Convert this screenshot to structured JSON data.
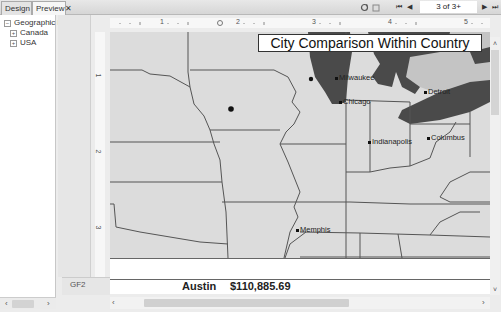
{
  "tabs": [
    {
      "label": "Design",
      "active": false
    },
    {
      "label": "Preview",
      "active": true,
      "close": "✕"
    }
  ],
  "toolbar": {
    "page_indicator": "3 of 3+",
    "first_icon": "⏮",
    "prev_icon": "◀",
    "next_icon": "▶",
    "last_icon": "⏭"
  },
  "tree": {
    "root": {
      "label": "Geographic I",
      "toggle": "⊟"
    },
    "children": [
      {
        "label": "Canada",
        "toggle": "⊞"
      },
      {
        "label": "USA",
        "toggle": "⊞"
      }
    ]
  },
  "rulers": {
    "top_numbers": [
      "1",
      "2",
      "3",
      "4",
      "5"
    ],
    "left_numbers": [
      "1",
      "2",
      "3"
    ]
  },
  "report": {
    "title": "City Comparison Within Country",
    "cities": [
      {
        "name": "Milwaukee"
      },
      {
        "name": "Chicago"
      },
      {
        "name": "Detroit"
      },
      {
        "name": "Indianapolis"
      },
      {
        "name": "Columbus"
      },
      {
        "name": "Memphis"
      }
    ],
    "group_footer_label": "GF2",
    "footer_city": "Austin",
    "footer_amount": "$110,885.69"
  },
  "colors": {
    "map_land": "#dcdcdc",
    "water": "#4a4a4a",
    "canada_land": "#c4c4c4",
    "border": "#555555"
  }
}
